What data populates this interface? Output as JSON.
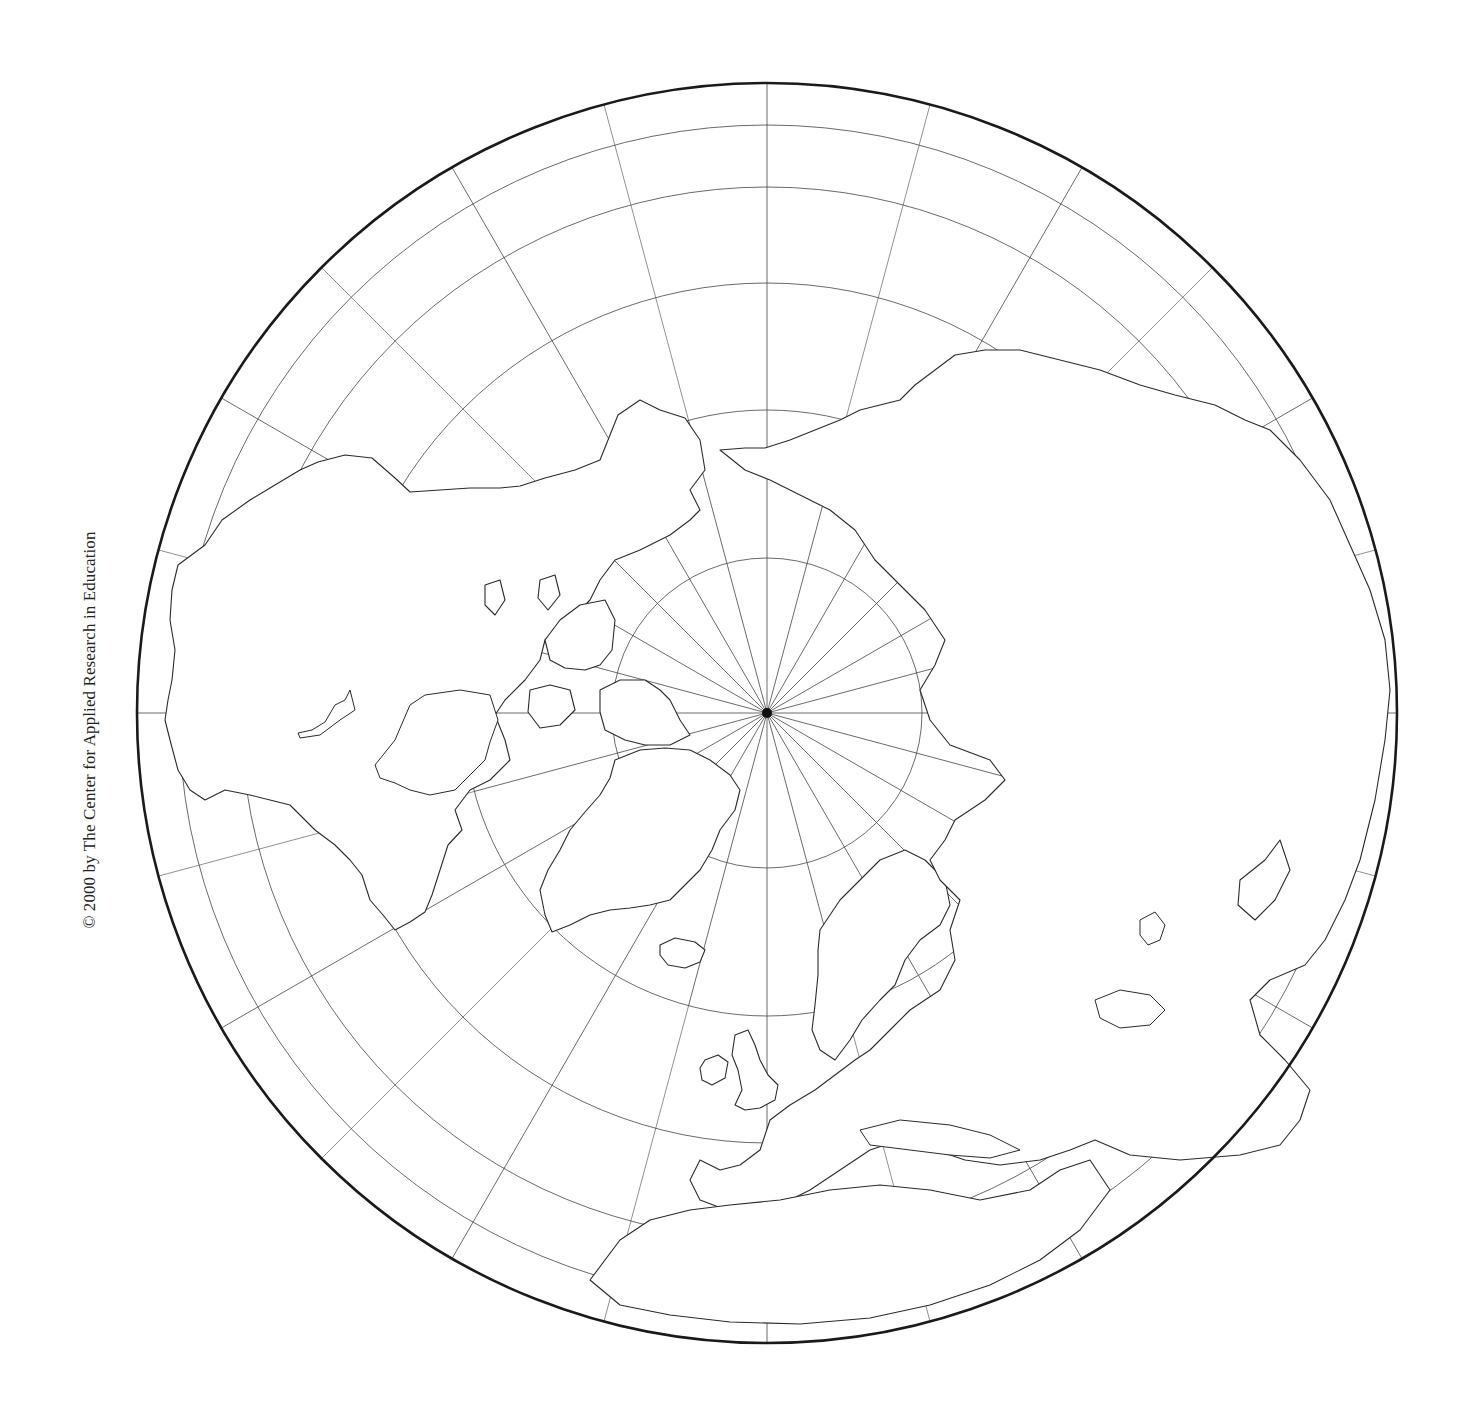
{
  "map": {
    "title": "Northern Hemisphere polar projection outline map",
    "copyright": "© 2000 by The Center for Applied Research in Education",
    "projection": "polar (north pole centered)",
    "center": {
      "x": 767,
      "y": 713
    },
    "outer_radius": {
      "rx": 630,
      "ry": 611
    },
    "colors": {
      "background": "#ffffff",
      "line": "#444444",
      "outline": "#1a1a1a",
      "land_stroke": "#2a2a2a"
    },
    "parallels": [
      {
        "label": "pole region circle",
        "r": 155
      },
      {
        "label": "arctic circle region",
        "r": 303
      },
      {
        "label": "parallel 3",
        "r": 430
      },
      {
        "label": "parallel 4",
        "r": 526
      },
      {
        "label": "parallel 5",
        "r": 588
      }
    ],
    "inner_meridian_count": 24,
    "outer_meridian_count": 12,
    "regions": [
      {
        "name": "North America"
      },
      {
        "name": "Greenland"
      },
      {
        "name": "Europe"
      },
      {
        "name": "Asia"
      },
      {
        "name": "Africa"
      },
      {
        "name": "Iceland"
      },
      {
        "name": "British Isles"
      },
      {
        "name": "Arctic Archipelago"
      }
    ]
  }
}
